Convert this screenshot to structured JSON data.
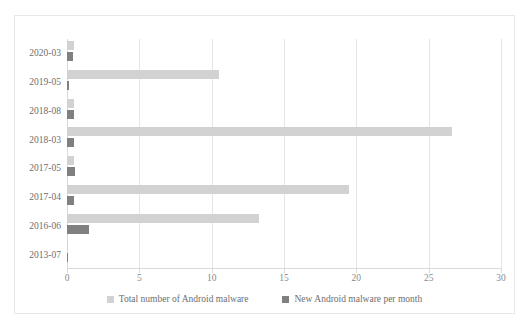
{
  "chart_data": {
    "type": "bar",
    "orientation": "horizontal",
    "title": "",
    "subtitle": "",
    "xlabel": "",
    "ylabel": "",
    "xlim": [
      0,
      30
    ],
    "xticks": [
      0,
      5,
      10,
      15,
      20,
      25,
      30
    ],
    "xtick_labels": [
      "0",
      "5",
      "10",
      "15",
      "20",
      "25",
      "30"
    ],
    "grid": true,
    "grid_axis": "x",
    "legend_position": "bottom-center",
    "categories": [
      "2020-03",
      "2019-05",
      "2018-08",
      "2018-03",
      "2017-05",
      "2017-04",
      "2016-06",
      "2013-07"
    ],
    "series": [
      {
        "name": "Total number of Android malware",
        "color": "#d2d2d2",
        "values": [
          0.5,
          10.5,
          0.5,
          26.6,
          0.5,
          19.5,
          13.3,
          0.05
        ]
      },
      {
        "name": "New Android malware per month",
        "color": "#808080",
        "values": [
          0.4,
          0.15,
          0.5,
          0.5,
          0.55,
          0.45,
          1.5,
          0.02
        ]
      }
    ]
  },
  "legend": {
    "items": [
      {
        "label": "Total number of Android malware",
        "color": "#d2d2d2",
        "swatch": "square-swatch"
      },
      {
        "label": "New Android malware per month",
        "color": "#808080",
        "swatch": "square-swatch"
      }
    ]
  },
  "colors": {
    "series_total": "#d2d2d2",
    "series_new": "#808080",
    "gridline": "#e4e4e4",
    "axis": "#d9d9d9",
    "tick_text": "#8a8a8a",
    "label_text": "#6e6e6e",
    "frame_border": "#e8e8e8",
    "background": "#ffffff"
  }
}
